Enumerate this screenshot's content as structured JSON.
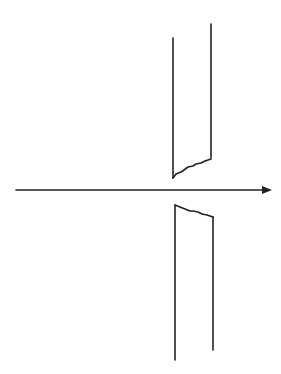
{
  "diagram": {
    "colors": {
      "background": "#ffffff",
      "ink": "#222222"
    },
    "stroke_width": 1.6,
    "arrow": {
      "x1": 16,
      "y1": 190,
      "x2": 272,
      "y2": 190,
      "head": "20.5,190 11,186 11,194"
    },
    "upper_piece": {
      "left_line": {
        "x1": 173,
        "y1": 38,
        "x2": 173,
        "y2": 178
      },
      "right_line": {
        "x1": 211,
        "y1": 24,
        "x2": 211,
        "y2": 158
      },
      "broken_edge": "173,178 176,174 181,172 184,170 188,167 193,166 196,164 201,163 205,161 211,159"
    },
    "lower_piece": {
      "left_line": {
        "x1": 175,
        "y1": 205,
        "x2": 175,
        "y2": 360
      },
      "right_line": {
        "x1": 213,
        "y1": 217,
        "x2": 213,
        "y2": 350
      },
      "broken_edge": "175,205 180,207 185,209 190,211 193,211 198,212 202,214 207,215 213,217"
    }
  }
}
